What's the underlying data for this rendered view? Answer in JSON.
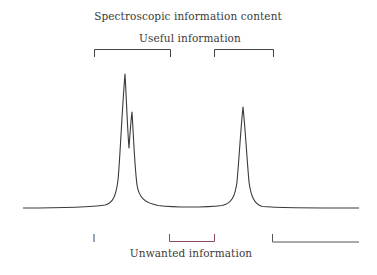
{
  "title": "Spectroscopic information content",
  "top_label": "Useful information",
  "bottom_label": "Unwanted information",
  "colors": {
    "spectrum": "#3a3a3a",
    "bracket": "#444444",
    "unwanted_left_start": "#e8b070",
    "unwanted_left_end": "#4a7fc0",
    "unwanted_middle": "#8a4050",
    "unwanted_right": "#555555"
  },
  "peaks": [
    {
      "name": "peak-1-main",
      "x": 125,
      "top_y": 74
    },
    {
      "name": "peak-2-shoulder",
      "x": 132,
      "top_y": 112
    },
    {
      "name": "peak-3",
      "x": 243,
      "top_y": 107
    }
  ],
  "useful_brackets": [
    {
      "x1": 94,
      "x2": 170
    },
    {
      "x1": 214,
      "x2": 273
    }
  ],
  "unwanted_brackets": [
    {
      "x1": 23,
      "x2": 94
    },
    {
      "x1": 169,
      "x2": 214
    },
    {
      "x1": 272,
      "x2": 359
    }
  ]
}
